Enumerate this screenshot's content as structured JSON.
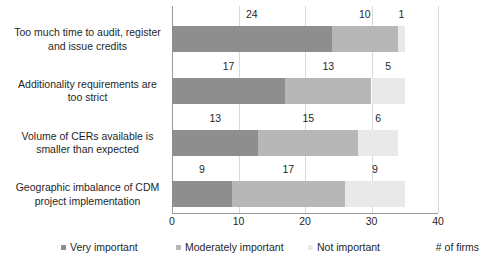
{
  "chart_data": {
    "type": "bar",
    "subtype": "stacked-horizontal",
    "title": "",
    "xlabel": "# of firms",
    "ylabel": "",
    "xlim": [
      0,
      40
    ],
    "xticks": [
      0,
      10,
      20,
      30,
      40
    ],
    "grid": true,
    "legend_position": "bottom",
    "categories": [
      "Too much time to audit, register and issue credits",
      "Additionality requirements are too strict",
      "Volume of CERs available is smaller than expected",
      "Geographic imbalance of CDM project implementation"
    ],
    "series": [
      {
        "name": "Very important",
        "color": "#8e8e8e",
        "values": [
          24,
          17,
          13,
          9
        ]
      },
      {
        "name": "Moderately important",
        "color": "#b7b7b7",
        "values": [
          10,
          13,
          15,
          17
        ]
      },
      {
        "name": "Not important",
        "color": "#e9e9e9",
        "values": [
          1,
          5,
          6,
          9
        ]
      }
    ],
    "totals": [
      35,
      35,
      34,
      35
    ]
  },
  "category_lines": [
    [
      "Too much time to audit, register",
      "and issue credits"
    ],
    [
      "Additionality requirements are",
      "too strict"
    ],
    [
      "Volume of CERs available is",
      "smaller than expected"
    ],
    [
      "Geographic imbalance of CDM",
      "project implementation"
    ]
  ],
  "axis": {
    "tick_labels": [
      "0",
      "10",
      "20",
      "30",
      "40"
    ],
    "x_axis_title": "# of firms"
  },
  "legend": {
    "items": [
      {
        "label": "Very important"
      },
      {
        "label": "Moderately important"
      },
      {
        "label": "Not important"
      }
    ]
  },
  "data_labels": [
    [
      "24",
      "10",
      "1"
    ],
    [
      "17",
      "13",
      "5"
    ],
    [
      "13",
      "15",
      "6"
    ],
    [
      "9",
      "17",
      "9"
    ]
  ]
}
